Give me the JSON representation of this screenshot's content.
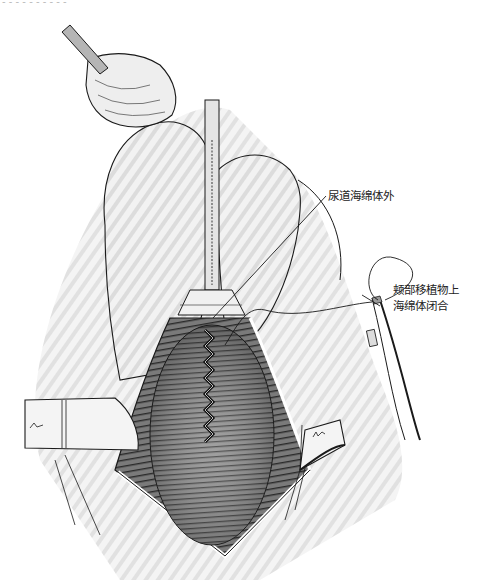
{
  "header_fragment": "- - - - - - - - - -",
  "labels": {
    "urethral_spongiosum_outer": "尿道海绵体外",
    "graft_line1": "颊部移植物上",
    "graft_line2": "海绵体闭合"
  },
  "colors": {
    "ink": "#1a1a1a",
    "skin_shade": "#d9d9d9",
    "tissue_dark": "#555555",
    "tissue_mid": "#8a8a8a",
    "background": "#ffffff"
  }
}
